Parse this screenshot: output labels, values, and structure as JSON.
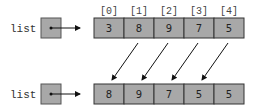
{
  "top": {
    "variable_label": "list",
    "indices": [
      "[0]",
      "[1]",
      "[2]",
      "[3]",
      "[4]"
    ],
    "values": [
      "3",
      "8",
      "9",
      "7",
      "5"
    ]
  },
  "bottom": {
    "variable_label": "list",
    "values": [
      "8",
      "9",
      "7",
      "5",
      "5"
    ]
  },
  "colors": {
    "cell_fill": "#a8a8a8",
    "border": "#333333",
    "arrow": "#111111"
  }
}
